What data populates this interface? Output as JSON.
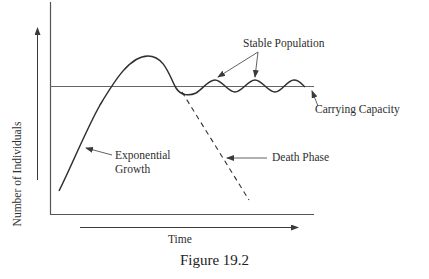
{
  "figure": {
    "caption": "Figure 19.2",
    "x_axis_label": "Time",
    "y_axis_label": "Number of Individuals",
    "annotations": {
      "stable_population": "Stable Population",
      "carrying_capacity": "Carrying Capacity",
      "exponential_growth_line1": "Exponential",
      "exponential_growth_line2": "Growth",
      "death_phase": "Death Phase"
    }
  },
  "colors": {
    "line": "#3a3a3a",
    "axis": "#555555",
    "background": "#ffffff"
  }
}
